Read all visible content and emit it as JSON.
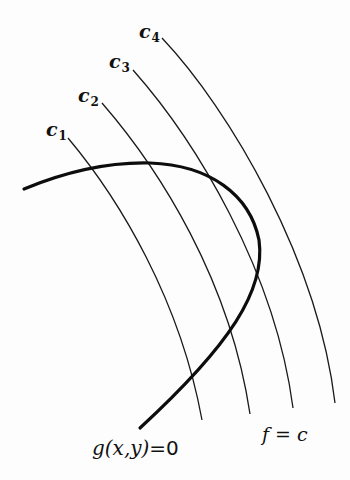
{
  "diagram": {
    "type": "lagrange-multiplier-level-curves",
    "constraint_label": {
      "lhs": "g(x,y)",
      "eq": "=",
      "rhs": "0"
    },
    "level_set_label": "f = c",
    "level_curves": [
      {
        "name": "c",
        "sub": "1"
      },
      {
        "name": "c",
        "sub": "2"
      },
      {
        "name": "c",
        "sub": "3"
      },
      {
        "name": "c",
        "sub": "4"
      }
    ],
    "colors": {
      "ink": "#111111",
      "background": "#fdfdfd"
    }
  }
}
